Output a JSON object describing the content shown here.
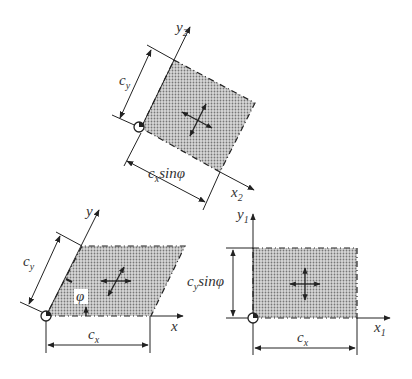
{
  "diagram": {
    "fill_color": "#c8c8c8",
    "stroke_color": "#222222",
    "figures": [
      {
        "id": "rotated",
        "description": "Rotated rectangle in x2-y2 frame",
        "x_axis_label": "x",
        "x_axis_sub": "2",
        "y_axis_label": "y",
        "y_axis_sub": "2",
        "dim_vertical": "c",
        "dim_vertical_sub": "y",
        "dim_horizontal": "c",
        "dim_horizontal_sub": "x",
        "dim_horizontal_suffix": "sinφ"
      },
      {
        "id": "parallelogram",
        "description": "Skewed parallelogram in x-y frame",
        "x_axis_label": "x",
        "y_axis_label": "y",
        "dim_vertical": "c",
        "dim_vertical_sub": "y",
        "dim_horizontal": "c",
        "dim_horizontal_sub": "x",
        "angle_label": "φ"
      },
      {
        "id": "rectangle",
        "description": "Axis-aligned rectangle in x1-y1 frame",
        "x_axis_label": "x",
        "x_axis_sub": "1",
        "y_axis_label": "y",
        "y_axis_sub": "1",
        "dim_vertical": "c",
        "dim_vertical_sub": "y",
        "dim_vertical_suffix": "sinφ",
        "dim_horizontal": "c",
        "dim_horizontal_sub": "x"
      }
    ]
  }
}
